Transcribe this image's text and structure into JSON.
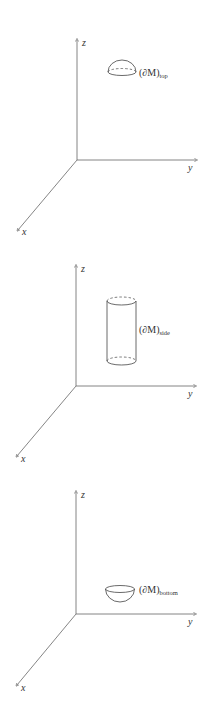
{
  "colors": {
    "stroke": "#555555",
    "text": "#333333",
    "background": "#ffffff"
  },
  "panels": [
    {
      "name": "top",
      "axes": {
        "x_label": "x",
        "y_label": "y",
        "z_label": "z"
      },
      "surface": {
        "shape": "upper-hemisphere",
        "label_main": "(∂M)",
        "label_sub": "top"
      }
    },
    {
      "name": "side",
      "axes": {
        "x_label": "x",
        "y_label": "y",
        "z_label": "z"
      },
      "surface": {
        "shape": "open-cylinder",
        "label_main": "(∂M)",
        "label_sub": "side"
      }
    },
    {
      "name": "bottom",
      "axes": {
        "x_label": "x",
        "y_label": "y",
        "z_label": "z"
      },
      "surface": {
        "shape": "lower-hemisphere",
        "label_main": "(∂M)",
        "label_sub": "bottom"
      }
    }
  ]
}
